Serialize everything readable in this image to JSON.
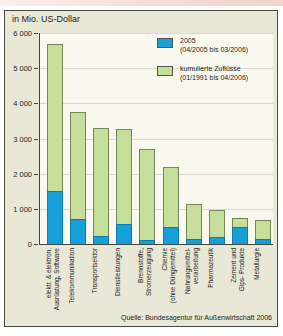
{
  "page": {
    "source": "Quelle: Bundesagentur für Außenwirtschaft 2006"
  },
  "colors": {
    "accent_top_strip": "#f0d4cc",
    "frame_background": "#e9e7d5",
    "plot_background": "#faf9f0",
    "gridline": "#d9d9cd",
    "bar_2005": "#169fd9",
    "bar_2005_border": "#0c7cab",
    "bar_cumulative": "#c5df9b",
    "bar_cumulative_border": "#76875b"
  },
  "chart_data": {
    "type": "bar",
    "title": "in Mio. US-Dollar",
    "note": "stacked overlay: blue 2005 segment drawn at base of green cumulative bar",
    "ylim": [
      0,
      6000
    ],
    "grid": true,
    "legend_position": "top-right",
    "yticks": [
      {
        "label": "6 000",
        "value": 6000
      },
      {
        "label": "5 000",
        "value": 5000
      },
      {
        "label": "4 000",
        "value": 4000
      },
      {
        "label": "3 000",
        "value": 3000
      },
      {
        "label": "2 000",
        "value": 2000
      },
      {
        "label": "1 000",
        "value": 1000
      },
      {
        "label": "0",
        "value": 0
      }
    ],
    "categories": [
      "elektr. & elektron. Ausrüstung, Software",
      "Telekommunikation",
      "Transportsektor",
      "Dienstleistungen",
      "Brennstoffe, Stromerzeugung",
      "Chemie (ohne Düngemittel)",
      "Nahrungsmittelverarbeitung",
      "Pharmazeutik",
      "Zement und Gips- Produkte",
      "Metallurgie"
    ],
    "categories_lines": [
      [
        "elektr. & elektron.",
        "Ausrüstung, Software"
      ],
      [
        "Telekommunikation"
      ],
      [
        "Transportsektor"
      ],
      [
        "Dienstleistungen"
      ],
      [
        "Brennstoffe,",
        "Stromerzeugung"
      ],
      [
        "Chemie",
        "(ohne Düngemittel)"
      ],
      [
        "Nahrungsmittel-",
        "verarbeitung"
      ],
      [
        "Pharmazeutik"
      ],
      [
        "Zement und",
        "Gips- Produkte"
      ],
      [
        "Metallurgie"
      ]
    ],
    "series": [
      {
        "name": "2005 (04/2005 bis 03/2006)",
        "label_lines": [
          "2005",
          "(04/2005 bis 03/2006)"
        ],
        "color": "#169fd9",
        "values": [
          1500,
          700,
          230,
          560,
          120,
          470,
          140,
          190,
          480,
          130
        ]
      },
      {
        "name": "kumulierte Zuflüsse (01/1991 bis 04/2006)",
        "label_lines": [
          "kumulierte Zuflüsse",
          "(01/1991 bis 04/2006)"
        ],
        "color": "#c5df9b",
        "values": [
          5700,
          3750,
          3300,
          3280,
          2700,
          2200,
          1150,
          960,
          740,
          670
        ]
      }
    ]
  }
}
